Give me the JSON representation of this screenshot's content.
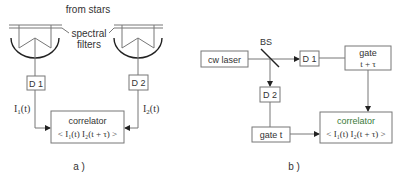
{
  "panel_a": {
    "title": "a )",
    "source_label": "from stars",
    "filter_label_line1": "spectral",
    "filter_label_line2": "filters",
    "detector1": "D 1",
    "detector2": "D 2",
    "signal1": "I",
    "signal1_sub": "1",
    "signal1_arg": "(t)",
    "signal2": "I",
    "signal2_sub": "2",
    "signal2_arg": "(t)",
    "correlator_title": "correlator",
    "correlator_formula": "< I₁(t) I₂(t + τ) >"
  },
  "panel_b": {
    "title": "b )",
    "laser": "cw laser",
    "beamsplitter": "BS",
    "detector1": "D 1",
    "detector2": "D 2",
    "gate1_line1": "gate",
    "gate1_line2": "t + τ",
    "gate2": "gate t",
    "correlator_title": "correlator",
    "correlator_formula": "< I₁(t) I₂(t + τ) >"
  },
  "colors": {
    "line": "#777777",
    "text": "#333333",
    "accent_green": "#3a7a3a"
  }
}
